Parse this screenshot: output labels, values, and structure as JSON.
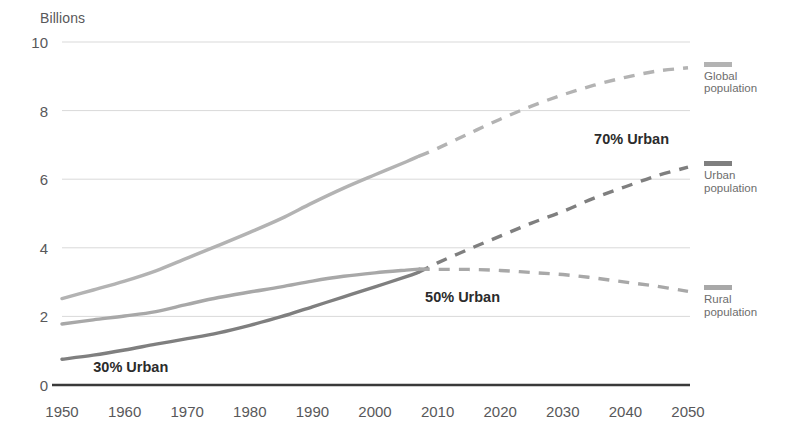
{
  "chart_data": {
    "type": "line",
    "title": "",
    "ylabel": "Billions",
    "xlabel": "",
    "ylim": [
      0,
      10
    ],
    "xlim": [
      1950,
      2050
    ],
    "yticks": [
      "0",
      "2",
      "4",
      "6",
      "8",
      "10"
    ],
    "ytick_values": [
      0,
      2,
      4,
      6,
      8,
      10
    ],
    "xticks": [
      "1950",
      "1960",
      "1970",
      "1980",
      "1990",
      "2000",
      "2010",
      "2020",
      "2030",
      "2040",
      "2050"
    ],
    "xtick_values": [
      1950,
      1960,
      1970,
      1980,
      1990,
      2000,
      2010,
      2020,
      2030,
      2040,
      2050
    ],
    "grid": true,
    "grid_axis": "y",
    "legend_position": "right",
    "projection_start_year": 2007,
    "x": [
      1950,
      1955,
      1960,
      1965,
      1970,
      1975,
      1980,
      1985,
      1990,
      1995,
      2000,
      2005,
      2007,
      2010,
      2015,
      2020,
      2025,
      2030,
      2035,
      2040,
      2045,
      2050
    ],
    "series": [
      {
        "name": "Global population",
        "color": "#b3b3b3",
        "legend_label_line1": "Global",
        "legend_label_line2": "population",
        "values": [
          2.52,
          2.77,
          3.03,
          3.33,
          3.7,
          4.07,
          4.45,
          4.85,
          5.31,
          5.74,
          6.13,
          6.51,
          6.67,
          6.9,
          7.33,
          7.75,
          8.13,
          8.46,
          8.74,
          8.97,
          9.15,
          9.25
        ]
      },
      {
        "name": "Urban population",
        "color": "#7f7f7f",
        "legend_label_line1": "Urban",
        "legend_label_line2": "population",
        "values": [
          0.75,
          0.87,
          1.02,
          1.19,
          1.35,
          1.52,
          1.74,
          1.99,
          2.28,
          2.57,
          2.86,
          3.16,
          3.29,
          3.56,
          3.96,
          4.34,
          4.72,
          5.06,
          5.45,
          5.78,
          6.1,
          6.35
        ]
      },
      {
        "name": "Rural population",
        "color": "#a8a8a8",
        "legend_label_line1": "Rural",
        "legend_label_line2": "population",
        "values": [
          1.78,
          1.9,
          2.01,
          2.14,
          2.35,
          2.55,
          2.71,
          2.86,
          3.03,
          3.17,
          3.27,
          3.35,
          3.38,
          3.37,
          3.37,
          3.34,
          3.28,
          3.22,
          3.12,
          3.0,
          2.88,
          2.73
        ]
      }
    ],
    "annotations": [
      {
        "text": "30% Urban",
        "x_year": 1955,
        "y_value": 0.5,
        "note": "urban share reaches 30%"
      },
      {
        "text": "50% Urban",
        "x_year": 2008,
        "y_value": 2.55,
        "note": "urban share reaches 50%"
      },
      {
        "text": "70% Urban",
        "x_year": 2035,
        "y_value": 7.15,
        "note": "urban share reaches 70%"
      }
    ]
  },
  "legend": {
    "entries": [
      {
        "line1": "Global",
        "line2": "population",
        "color": "#b3b3b3"
      },
      {
        "line1": "Urban",
        "line2": "population",
        "color": "#7f7f7f"
      },
      {
        "line1": "Rural",
        "line2": "population",
        "color": "#a8a8a8"
      }
    ]
  },
  "axis": {
    "y_title": "Billions"
  },
  "colors": {
    "background": "#ffffff",
    "gridline": "#d9d9d9",
    "baseline": "#3a3a3a",
    "tick_text": "#58585a",
    "annotation_text": "#2b2b2b",
    "legend_text": "#6d6d6d"
  }
}
